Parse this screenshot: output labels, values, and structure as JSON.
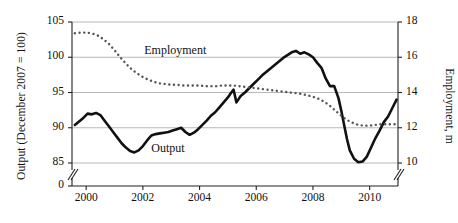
{
  "chart_data": {
    "type": "line",
    "title": "",
    "subtitle": "",
    "xlabel": "",
    "ylabel": "Output (December 2007 = 100)",
    "ylabel_right": "Employment, m",
    "grid": true,
    "legend": "inline-annotations",
    "xlim": [
      1999.5,
      2011.0
    ],
    "ylim_left": [
      85,
      105
    ],
    "ylim_right": [
      10,
      18
    ],
    "axis_break_left": true,
    "axis_break_note": "Left axis broken between 85 and 0",
    "xticks": [
      "2000",
      "2002",
      "2004",
      "2006",
      "2008",
      "2010"
    ],
    "xtick_values": [
      2000,
      2002,
      2004,
      2006,
      2008,
      2010
    ],
    "yticks_left": [
      "105",
      "100",
      "95",
      "90",
      "85",
      "0"
    ],
    "ytick_values_left": [
      105,
      100,
      95,
      90,
      85,
      0
    ],
    "yticks_right": [
      "18",
      "16",
      "14",
      "12",
      "10"
    ],
    "ytick_values_right": [
      18,
      16,
      14,
      12,
      10
    ],
    "annotations": [
      {
        "text": "Employment",
        "x": 2002.05,
        "y": 100.9,
        "name": "employment-label"
      },
      {
        "text": "Output",
        "x": 2002.3,
        "y": 87.0,
        "name": "output-label"
      }
    ],
    "series": [
      {
        "name": "Output",
        "style": "solid",
        "color": "#111111",
        "width": 2.6,
        "axis": "left",
        "unit": "December 2007 = 100",
        "x": [
          1999.6,
          1999.75,
          1999.9,
          2000.05,
          2000.2,
          2000.35,
          2000.5,
          2000.65,
          2000.8,
          2000.95,
          2001.1,
          2001.25,
          2001.4,
          2001.55,
          2001.7,
          2001.85,
          2002.0,
          2002.15,
          2002.3,
          2002.45,
          2002.6,
          2002.75,
          2002.9,
          2003.05,
          2003.2,
          2003.35,
          2003.5,
          2003.65,
          2003.8,
          2003.95,
          2004.1,
          2004.25,
          2004.4,
          2004.55,
          2004.7,
          2004.85,
          2005.0,
          2005.1,
          2005.2,
          2005.3,
          2005.45,
          2005.6,
          2005.75,
          2005.9,
          2006.05,
          2006.2,
          2006.35,
          2006.5,
          2006.65,
          2006.8,
          2006.95,
          2007.1,
          2007.25,
          2007.4,
          2007.55,
          2007.7,
          2007.85,
          2008.0,
          2008.15,
          2008.3,
          2008.45,
          2008.6,
          2008.75,
          2008.9,
          2009.0,
          2009.1,
          2009.2,
          2009.3,
          2009.45,
          2009.6,
          2009.75,
          2009.9,
          2010.05,
          2010.2,
          2010.35,
          2010.5,
          2010.65,
          2010.8,
          2010.95
        ],
        "values": [
          90.4,
          90.9,
          91.4,
          92.0,
          91.9,
          92.1,
          91.8,
          91.0,
          90.2,
          89.4,
          88.6,
          87.8,
          87.2,
          86.7,
          86.5,
          86.8,
          87.4,
          88.2,
          88.9,
          89.1,
          89.2,
          89.3,
          89.4,
          89.6,
          89.8,
          90.0,
          89.4,
          89.0,
          89.3,
          89.8,
          90.4,
          91.0,
          91.7,
          92.2,
          92.9,
          93.6,
          94.3,
          94.9,
          95.4,
          93.6,
          94.5,
          95.0,
          95.6,
          96.2,
          96.8,
          97.4,
          97.9,
          98.4,
          98.9,
          99.4,
          99.9,
          100.3,
          100.7,
          100.9,
          100.5,
          100.7,
          100.4,
          100.0,
          99.2,
          98.5,
          97.0,
          95.9,
          95.9,
          94.2,
          92.4,
          90.4,
          88.4,
          86.8,
          85.6,
          85.1,
          85.2,
          85.9,
          87.2,
          88.5,
          89.6,
          90.8,
          91.6,
          92.8,
          94.0
        ]
      },
      {
        "name": "Employment",
        "style": "dotted",
        "color": "#555555",
        "width": 2.4,
        "axis": "right",
        "unit": "m",
        "x": [
          1999.6,
          1999.8,
          2000.0,
          2000.2,
          2000.4,
          2000.6,
          2000.8,
          2001.0,
          2001.2,
          2001.4,
          2001.6,
          2001.8,
          2002.0,
          2002.2,
          2002.4,
          2002.6,
          2002.8,
          2003.0,
          2003.2,
          2003.4,
          2003.6,
          2003.8,
          2004.0,
          2004.2,
          2004.4,
          2004.6,
          2004.8,
          2005.0,
          2005.2,
          2005.4,
          2005.6,
          2005.8,
          2006.0,
          2006.2,
          2006.4,
          2006.6,
          2006.8,
          2007.0,
          2007.2,
          2007.4,
          2007.6,
          2007.8,
          2008.0,
          2008.2,
          2008.4,
          2008.6,
          2008.8,
          2009.0,
          2009.2,
          2009.4,
          2009.6,
          2009.8,
          2010.0,
          2010.2,
          2010.4,
          2010.6,
          2010.8,
          2010.95
        ],
        "values_left_scale": [
          103.4,
          103.5,
          103.5,
          103.4,
          103.1,
          102.6,
          101.9,
          101.0,
          100.0,
          99.1,
          98.3,
          97.7,
          97.2,
          96.8,
          96.5,
          96.3,
          96.2,
          96.1,
          96.1,
          96.0,
          96.0,
          96.0,
          96.0,
          95.9,
          95.9,
          95.9,
          96.0,
          96.0,
          96.0,
          95.9,
          95.8,
          95.7,
          95.6,
          95.5,
          95.4,
          95.3,
          95.2,
          95.1,
          95.0,
          94.9,
          94.8,
          94.6,
          94.4,
          94.1,
          93.7,
          93.1,
          92.4,
          91.7,
          91.1,
          90.7,
          90.4,
          90.3,
          90.3,
          90.4,
          90.5,
          90.5,
          90.5,
          90.5
        ],
        "values": [
          13.36,
          13.4,
          13.4,
          13.36,
          13.24,
          13.04,
          12.76,
          12.4,
          12.0,
          11.64,
          11.32,
          11.08,
          10.88,
          10.72,
          10.6,
          10.52,
          10.48,
          10.44,
          10.44,
          10.4,
          10.4,
          10.4,
          10.4,
          10.36,
          10.36,
          10.36,
          10.4,
          10.4,
          10.4,
          10.36,
          10.32,
          10.28,
          10.24,
          10.2,
          10.16,
          10.12,
          10.08,
          10.04,
          10.0,
          9.96,
          9.92,
          9.84,
          9.76,
          9.64,
          9.48,
          9.24,
          8.96,
          8.68,
          8.44,
          8.28,
          8.16,
          8.12,
          8.12,
          8.16,
          8.2,
          8.2,
          8.2,
          8.2
        ]
      }
    ]
  }
}
